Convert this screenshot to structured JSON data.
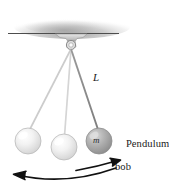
{
  "figure": {
    "labels": {
      "length": "L",
      "mass": "m",
      "bob_line1": "Pendulum",
      "bob_line2": "bob"
    },
    "colors": {
      "ceiling_line": "#4d4d4d",
      "ceiling_shade": "#b8b8b8",
      "string_light": "#c9c9c9",
      "string_dark": "#8e8e8e",
      "bob_light_fill": "#e9e9e9",
      "bob_dark_fill": "#a8a8a8",
      "bob_stroke": "#9a9a9a",
      "arrow": "#111111",
      "text": "#1a1a1a",
      "background": "#ffffff"
    },
    "geometry": {
      "pivot": {
        "x": 71,
        "y": 44
      },
      "ceiling_y": 33,
      "ceiling_x_start": 8,
      "ceiling_x_end": 118,
      "bobs": [
        {
          "name": "bob-left-extreme",
          "cx": 28,
          "cy": 141,
          "r": 13,
          "shade": "light"
        },
        {
          "name": "bob-center",
          "cx": 64,
          "cy": 147,
          "r": 13,
          "shade": "light"
        },
        {
          "name": "bob-right-extreme",
          "cx": 99,
          "cy": 141,
          "r": 13,
          "shade": "dark"
        }
      ],
      "arc_arrow_long": {
        "from_x": 112,
        "to_x": 14,
        "y": 178,
        "direction": "left"
      },
      "arc_arrow_short": {
        "from_x": 78,
        "to_x": 113,
        "y": 172,
        "direction": "right"
      }
    }
  }
}
